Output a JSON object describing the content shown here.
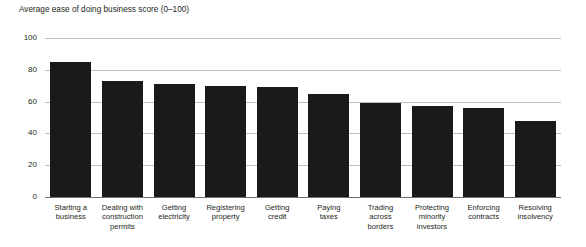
{
  "chart_data": {
    "type": "bar",
    "title": "Average ease of doing business score (0–100)",
    "xlabel": "",
    "ylabel": "",
    "ylim": [
      0,
      100
    ],
    "yticks": [
      0,
      20,
      40,
      60,
      80,
      100
    ],
    "grid": true,
    "legend": "none",
    "bar_color": "#1a1a1a",
    "gridline_color": "#bcbdc0",
    "axis_color": "#6d6e71",
    "categories": [
      "Starting a business",
      "Dealing with construction permits",
      "Getting electricity",
      "Registering property",
      "Getting credit",
      "Paying taxes",
      "Trading across borders",
      "Protecting minority investors",
      "Enforcing contracts",
      "Resolving insolvency"
    ],
    "category_lines": [
      [
        "Starting a",
        "business"
      ],
      [
        "Dealing with",
        "construction",
        "permits"
      ],
      [
        "Getting",
        "electricity"
      ],
      [
        "Registering",
        "property"
      ],
      [
        "Getting",
        "credit"
      ],
      [
        "Paying",
        "taxes"
      ],
      [
        "Trading",
        "across",
        "borders"
      ],
      [
        "Protecting",
        "minority",
        "investors"
      ],
      [
        "Enforcing",
        "contracts"
      ],
      [
        "Resolving",
        "insolvency"
      ]
    ],
    "values": [
      85,
      73,
      71,
      70,
      69,
      65,
      59,
      57,
      56,
      48
    ]
  }
}
